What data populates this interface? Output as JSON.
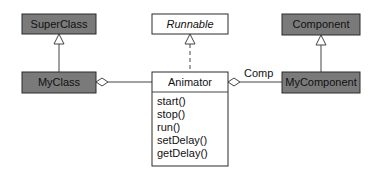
{
  "diagram": {
    "type": "uml-class-diagram",
    "classes": {
      "superclass": {
        "name": "SuperClass",
        "style": "dark"
      },
      "myclass": {
        "name": "MyClass",
        "style": "dark"
      },
      "runnable": {
        "name": "Runnable",
        "style": "interface"
      },
      "animator": {
        "name": "Animator",
        "style": "light",
        "methods": [
          "start()",
          "stop()",
          "run()",
          "setDelay()",
          "getDelay()"
        ]
      },
      "component": {
        "name": "Component",
        "style": "dark"
      },
      "mycomponent": {
        "name": "MyComponent",
        "style": "dark"
      }
    },
    "relations": [
      {
        "from": "MyClass",
        "to": "SuperClass",
        "kind": "generalization"
      },
      {
        "from": "Animator",
        "to": "Runnable",
        "kind": "realization"
      },
      {
        "from": "MyComponent",
        "to": "Component",
        "kind": "generalization"
      },
      {
        "from": "Animator",
        "to": "MyClass",
        "kind": "aggregation"
      },
      {
        "from": "MyComponent",
        "to": "Animator",
        "kind": "aggregation",
        "label": "Comp"
      }
    ],
    "colors": {
      "dark_fill": "#7a7a7a",
      "light_fill": "#ffffff",
      "stroke": "#2a2a2a"
    }
  }
}
